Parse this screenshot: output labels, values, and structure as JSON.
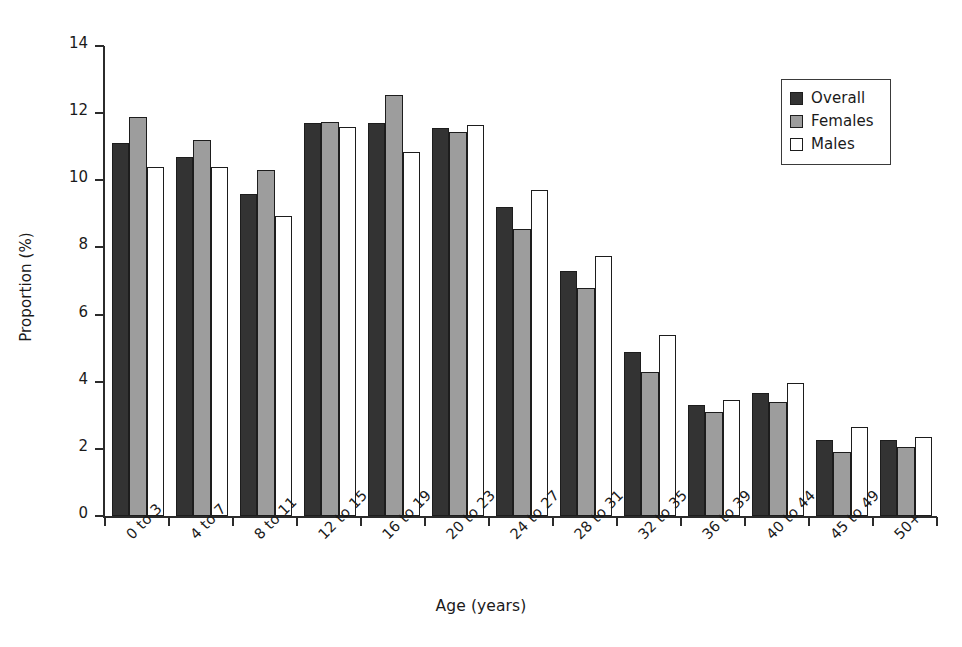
{
  "chart_data": {
    "type": "bar",
    "title": "",
    "subtitle": "",
    "xlabel": "Age (years)",
    "ylabel": "Proportion (%)",
    "ylim": [
      0,
      14
    ],
    "yticks": [
      0,
      2,
      4,
      6,
      8,
      10,
      12,
      14
    ],
    "grid": false,
    "legend_position": "top-right",
    "categories": [
      "0 to 3",
      "4 to 7",
      "8 to 11",
      "12 to 15",
      "16 to 19",
      "20 to 23",
      "24 to 27",
      "28 to 31",
      "32 to 35",
      "36 to 39",
      "40 to 44",
      "45 to 49",
      "50+"
    ],
    "series": [
      {
        "name": "Overall",
        "color": "#333333",
        "values": [
          11.1,
          10.7,
          9.6,
          11.7,
          11.7,
          11.55,
          9.2,
          7.3,
          4.9,
          3.3,
          3.65,
          2.25,
          2.25
        ]
      },
      {
        "name": "Females",
        "color": "#9d9d9d",
        "values": [
          11.9,
          11.2,
          10.3,
          11.75,
          12.55,
          11.45,
          8.55,
          6.8,
          4.3,
          3.1,
          3.4,
          1.9,
          2.05
        ]
      },
      {
        "name": "Males",
        "color": "#ffffff",
        "values": [
          10.4,
          10.4,
          8.95,
          11.6,
          10.85,
          11.65,
          9.7,
          7.75,
          5.4,
          3.45,
          3.95,
          2.65,
          2.35
        ]
      }
    ]
  },
  "legend": {
    "items": [
      {
        "label": "Overall",
        "swatch": "overall"
      },
      {
        "label": "Females",
        "swatch": "females"
      },
      {
        "label": "Males",
        "swatch": "males"
      }
    ]
  }
}
